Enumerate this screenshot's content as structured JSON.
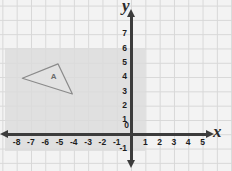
{
  "figure": {
    "axis_labels": {
      "x": "x",
      "y": "y"
    },
    "colors": {
      "background": "#f3f3f3",
      "grid": "#d3d3d3",
      "axis": "#3c3c3c",
      "shade": "#dcdcdc",
      "shape_fill": "#e3e3e3",
      "shape_stroke": "#8a8a8a",
      "tick_text": "#1d1d1d"
    }
  },
  "chart_data": {
    "type": "scatter",
    "title": "",
    "xlabel": "x",
    "ylabel": "y",
    "xlim": [
      -8.8,
      5.8
    ],
    "ylim": [
      -1.6,
      7.8
    ],
    "grid": true,
    "legend": "none",
    "x_ticks": [
      "-8",
      "-7",
      "-6",
      "-5",
      "-4",
      "-3",
      "-2",
      "-1",
      "0",
      "1",
      "2",
      "3",
      "4",
      "5"
    ],
    "x_tick_values": [
      -8,
      -7,
      -6,
      -5,
      -4,
      -3,
      -2,
      -1,
      0,
      1,
      2,
      3,
      4,
      5
    ],
    "y_ticks": [
      "-1",
      "0",
      "1",
      "2",
      "3",
      "4",
      "5",
      "6",
      "7"
    ],
    "y_tick_values": [
      -1,
      0,
      1,
      2,
      3,
      4,
      5,
      6,
      7
    ],
    "origin_label": "0",
    "shaded_region": {
      "label": "",
      "x_range": [
        -8.8,
        1.0
      ],
      "y_range": [
        -1.2,
        6.0
      ],
      "fill": "#dcdcdc"
    },
    "shapes": [
      {
        "name": "A",
        "type": "triangle",
        "label": "A",
        "vertices": [
          [
            -7.6,
            3.9
          ],
          [
            -5.1,
            4.9
          ],
          [
            -4.1,
            2.8
          ]
        ],
        "label_position": [
          -5.4,
          4.0
        ]
      }
    ]
  },
  "x_tick_labels": [
    {
      "text": "-8",
      "value": -8
    },
    {
      "text": "-7",
      "value": -7
    },
    {
      "text": "-6",
      "value": -6
    },
    {
      "text": "-5",
      "value": -5
    },
    {
      "text": "-4",
      "value": -4
    },
    {
      "text": "-3",
      "value": -3
    },
    {
      "text": "-2",
      "value": -2
    },
    {
      "text": "-1",
      "value": -1
    },
    {
      "text": "1",
      "value": 1
    },
    {
      "text": "2",
      "value": 2
    },
    {
      "text": "3",
      "value": 3
    },
    {
      "text": "4",
      "value": 4
    },
    {
      "text": "5",
      "value": 5
    }
  ],
  "y_tick_labels": [
    {
      "text": "7",
      "value": 7
    },
    {
      "text": "6",
      "value": 6
    },
    {
      "text": "5",
      "value": 5
    },
    {
      "text": "4",
      "value": 4
    },
    {
      "text": "3",
      "value": 3
    },
    {
      "text": "2",
      "value": 2
    },
    {
      "text": "1",
      "value": 1
    },
    {
      "text": "0",
      "value": 0
    },
    {
      "text": "-1",
      "value": -1
    }
  ],
  "origin": {
    "text": "0"
  },
  "triangle": {
    "label": "A"
  }
}
